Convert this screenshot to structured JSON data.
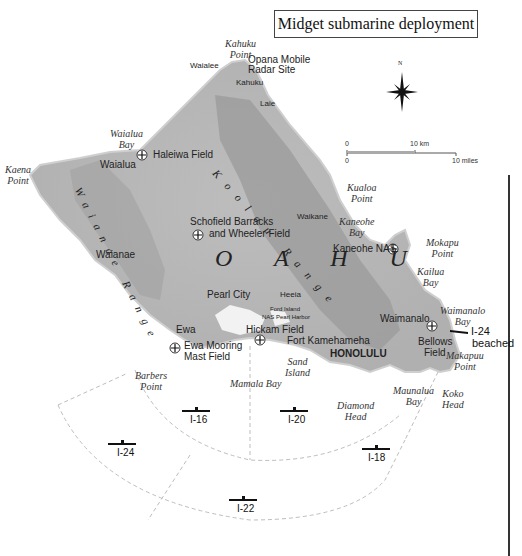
{
  "title": "Midget submarine deployment",
  "compass": {
    "north_label": "N"
  },
  "scale": {
    "zero_km": "0",
    "km_label": "10 km",
    "zero_mi": "0",
    "mi_label": "10 miles"
  },
  "island_label": "O A H U",
  "ranges": {
    "koolau": "Koolau Range",
    "waianae": "Waianae Range"
  },
  "places": {
    "waialee": "Waialee",
    "opana": "Opana Mobile",
    "opana2": "Radar Site",
    "kahuku": "Kahuku",
    "laie": "Laie",
    "haleiwa": "Haleiwa Field",
    "waialua": "Waialua",
    "schofield": "Schofield Barracks",
    "schofield2": "and Wheeler Field",
    "waianae": "Waianae",
    "waikane": "Waikane",
    "kaneohe_nas": "Kaneohe NAS",
    "pearl_city": "Pearl City",
    "heeia": "Heeia",
    "ford_island": "Ford Island",
    "nas_pearl": "NAS Pearl Harbor",
    "ewa": "Ewa",
    "ewa_mooring": "Ewa Mooring",
    "ewa_mooring2": "Mast Field",
    "hickam": "Hickam Field",
    "fort_kam": "Fort Kamehameha",
    "honolulu": "HONOLULU",
    "waimanalo": "Waimanalo",
    "bellows": "Bellows",
    "bellows2": "Field"
  },
  "features": {
    "kahuku_point": [
      "Kahuku",
      "Point"
    ],
    "waialua_bay": [
      "Waialua",
      "Bay"
    ],
    "kaena_point": [
      "Kaena",
      "Point"
    ],
    "kualoa_point": [
      "Kualoa",
      "Point"
    ],
    "kaneohe_bay": [
      "Kaneohe",
      "Bay"
    ],
    "mokapu_point": [
      "Mokapu",
      "Point"
    ],
    "kailua_bay": [
      "Kailua",
      "Bay"
    ],
    "waimanalo_bay": [
      "Waimanalo",
      "Bay"
    ],
    "makapuu_point": [
      "Makapuu",
      "Point"
    ],
    "barbers_point": [
      "Barbers",
      "Point"
    ],
    "mamala_bay": [
      "Mamala Bay"
    ],
    "sand_island": [
      "Sand",
      "Island"
    ],
    "diamond_head": [
      "Diamond",
      "Head"
    ],
    "maunalua_bay": [
      "Maunalua",
      "Bay"
    ],
    "koko_head": [
      "Koko",
      "Head"
    ]
  },
  "submarines": [
    {
      "id": "I-16",
      "label": "I-16"
    },
    {
      "id": "I-20",
      "label": "I-20"
    },
    {
      "id": "I-24",
      "label": "I-24"
    },
    {
      "id": "I-18",
      "label": "I-18"
    },
    {
      "id": "I-22",
      "label": "I-22"
    },
    {
      "id": "I-24-beached",
      "label": "I-24",
      "note": "beached"
    }
  ],
  "colors": {
    "land": "#b9b9b9",
    "land_dark": "#9a9a9a",
    "coast": "#d8d8d8",
    "sector": "#bbbbbb",
    "text": "#222222"
  }
}
